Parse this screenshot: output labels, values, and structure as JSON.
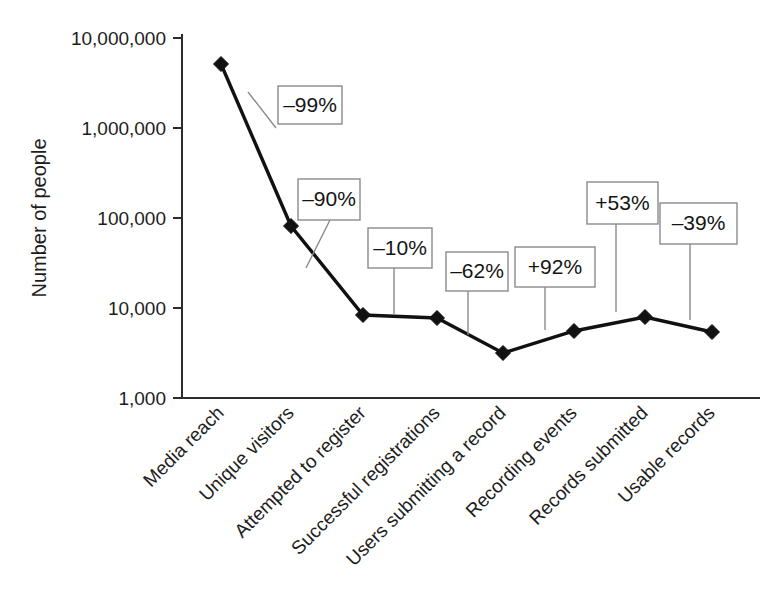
{
  "chart_data": {
    "type": "line",
    "title": "",
    "subtitle": "",
    "xlabel": "",
    "ylabel": "Number of people",
    "yscale": "log",
    "ylim": [
      1000,
      10000000
    ],
    "grid": false,
    "legend": "none",
    "categories": [
      "Media reach",
      "Unique visitors",
      "Attempted to register",
      "Successful registrations",
      "Users submitting a record",
      "Recording events",
      "Records submitted",
      "Usable records"
    ],
    "values": [
      5100000,
      70000,
      7800,
      7100,
      2600,
      5000,
      7600,
      4700
    ],
    "ytick_labels": [
      "10,000,000",
      "1,000,000",
      "100,000",
      "10,000",
      "1,000"
    ],
    "ytick_values": [
      10000000,
      1000000,
      100000,
      10000,
      1000
    ],
    "annotations": [
      {
        "label": "–99%",
        "from": "Media reach",
        "to": "Unique visitors"
      },
      {
        "label": "–90%",
        "from": "Unique visitors",
        "to": "Attempted to register"
      },
      {
        "label": "–10%",
        "from": "Attempted to register",
        "to": "Successful registrations"
      },
      {
        "label": "–62%",
        "from": "Successful registrations",
        "to": "Users submitting a record"
      },
      {
        "label": "+92%",
        "from": "Users submitting a record",
        "to": "Recording events"
      },
      {
        "label": "+53%",
        "from": "Recording events",
        "to": "Records submitted"
      },
      {
        "label": "–39%",
        "from": "Records submitted",
        "to": "Usable records"
      }
    ],
    "marker": "diamond",
    "series_color": "#111111",
    "background_color": "#ffffff"
  },
  "geometry": {
    "point_x": [
      221,
      291,
      363,
      437,
      503,
      574,
      645,
      712
    ],
    "point_y": [
      64,
      226,
      315,
      318,
      353,
      331,
      317,
      332
    ],
    "ytick_y": [
      38,
      128,
      218,
      308,
      398
    ],
    "axis_x": 182,
    "axis_y_top": 34,
    "axis_y_bottom": 398,
    "axis_x_right": 760,
    "boxes": [
      {
        "x": 278,
        "y": 86,
        "w": 64,
        "h": 38,
        "lx1": 276,
        "ly1": 128,
        "lx2": 248,
        "ly2": 92
      },
      {
        "x": 298,
        "y": 179,
        "w": 62,
        "h": 41,
        "lx1": 330,
        "ly1": 220,
        "lx2": 306,
        "ly2": 268
      },
      {
        "x": 368,
        "y": 228,
        "w": 64,
        "h": 40,
        "lx1": 394,
        "ly1": 268,
        "lx2": 394,
        "ly2": 315
      },
      {
        "x": 446,
        "y": 252,
        "w": 62,
        "h": 39,
        "lx1": 468,
        "ly1": 291,
        "lx2": 468,
        "ly2": 335
      },
      {
        "x": 515,
        "y": 247,
        "w": 80,
        "h": 40,
        "lx1": 545,
        "ly1": 287,
        "lx2": 545,
        "ly2": 330
      },
      {
        "x": 587,
        "y": 182,
        "w": 71,
        "h": 42,
        "lx1": 616,
        "ly1": 224,
        "lx2": 616,
        "ly2": 312
      },
      {
        "x": 660,
        "y": 203,
        "w": 77,
        "h": 41,
        "lx1": 690,
        "ly1": 244,
        "lx2": 690,
        "ly2": 320
      }
    ]
  }
}
